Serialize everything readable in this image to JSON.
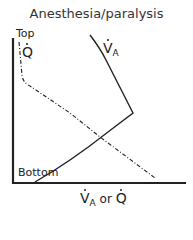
{
  "title": "Anesthesia/paralysis",
  "y_axis": {
    "top_label": "Top",
    "bottom_label": "Bottom"
  },
  "x_axis": {
    "label_main": "V",
    "label_sub": "A",
    "label_or": " or ",
    "label_q": "Q"
  },
  "curves": {
    "ventilation": {
      "symbol": "V",
      "subscript": "A",
      "style": "solid"
    },
    "perfusion": {
      "symbol": "Q",
      "style": "dash-dot"
    }
  },
  "colors": {
    "line": "#222222",
    "background": "#ffffff"
  }
}
